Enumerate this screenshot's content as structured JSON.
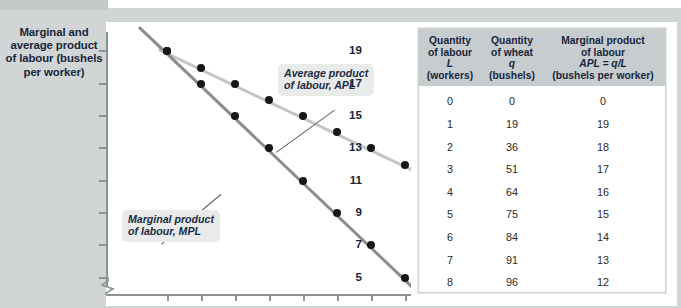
{
  "figure": {
    "y_axis_title": "Marginal and average product of labour (bushels per worker)"
  },
  "chart_data": {
    "type": "line",
    "title": "",
    "xlabel": "",
    "ylabel": "Marginal and average product of labour (bushels per worker)",
    "ytick_labels": [
      "19",
      "17",
      "15",
      "13",
      "11",
      "9",
      "7",
      "5"
    ],
    "ytick_values": [
      19,
      17,
      15,
      13,
      11,
      9,
      7,
      5
    ],
    "ylim": [
      4,
      20
    ],
    "xlim": [
      0,
      9
    ],
    "x": [
      1,
      2,
      3,
      4,
      5,
      6,
      7,
      8
    ],
    "xtick_count": 8,
    "xtick_labels": [
      "",
      "",
      "",
      "",
      "",
      "",
      "",
      ""
    ],
    "grid": false,
    "axis_break_y": true,
    "series": [
      {
        "name": "Average product of labour, APL",
        "color": "#c3c5c6",
        "values": [
          19,
          18,
          17,
          16,
          15,
          14,
          13,
          12
        ]
      },
      {
        "name": "Marginal product of labour, MPL",
        "color": "#8a8d8f",
        "values": [
          19,
          17,
          15,
          13,
          11,
          9,
          7,
          5
        ]
      }
    ],
    "annotations": [
      {
        "id": "apl",
        "text_line1": "Average product",
        "text_line2": "of labour,  APL"
      },
      {
        "id": "mpl",
        "text_line1": "Marginal product",
        "text_line2": "of labour,  MPL"
      }
    ]
  },
  "table": {
    "headers": [
      {
        "line1": "Quantity",
        "line2": "of labour",
        "symbol": "L",
        "line4": "(workers)"
      },
      {
        "line1": "Quantity",
        "line2": "of wheat",
        "symbol": "q",
        "line4": "(bushels)"
      },
      {
        "line1": "Marginal product",
        "line2": "of labour",
        "symbol": "APL = q/L",
        "line4": "(bushels per worker)"
      }
    ],
    "rows": [
      {
        "l": "0",
        "q": "0",
        "mpl": "0"
      },
      {
        "l": "1",
        "q": "19",
        "mpl": "19"
      },
      {
        "l": "2",
        "q": "36",
        "mpl": "18"
      },
      {
        "l": "3",
        "q": "51",
        "mpl": "17"
      },
      {
        "l": "4",
        "q": "64",
        "mpl": "16"
      },
      {
        "l": "5",
        "q": "75",
        "mpl": "15"
      },
      {
        "l": "6",
        "q": "84",
        "mpl": "14"
      },
      {
        "l": "7",
        "q": "91",
        "mpl": "13"
      },
      {
        "l": "8",
        "q": "96",
        "mpl": "12"
      }
    ]
  },
  "colors": {
    "panel": "#d2d5d6",
    "header": "#c7cccf",
    "apl_line": "#c3c5c6",
    "mpl_line": "#8a8d8f",
    "dot": "#161616",
    "text_dark": "#17263c"
  }
}
